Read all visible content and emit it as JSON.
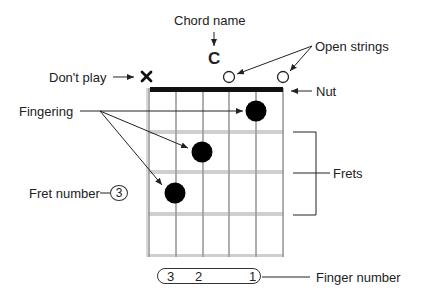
{
  "chord": {
    "name": "C"
  },
  "labels": {
    "chord_name": "Chord name",
    "open_strings": "Open strings",
    "dont_play": "Don't play",
    "nut": "Nut",
    "fingering": "Fingering",
    "frets": "Frets",
    "fret_number": "Fret number",
    "finger_number": "Finger number"
  },
  "fret_number_value": "3",
  "string_markers": [
    "x",
    "",
    "",
    "o",
    "",
    "o"
  ],
  "finger_numbers": [
    "3",
    "2",
    "1"
  ],
  "dots": [
    {
      "string": 5,
      "fret": 1,
      "finger": "1"
    },
    {
      "string": 3,
      "fret": 2,
      "finger": "2"
    },
    {
      "string": 2,
      "fret": 3,
      "finger": "3"
    }
  ],
  "colors": {
    "ink": "#111111",
    "fret": "#c8c8c8",
    "string": "#9a9a9a",
    "text": "#222222"
  }
}
